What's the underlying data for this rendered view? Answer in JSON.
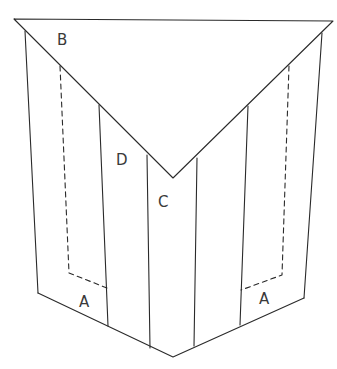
{
  "diagram": {
    "labels": {
      "flap": "B",
      "left_inner_panel": "D",
      "center_panel": "C",
      "left_bottom_panel": "A",
      "right_bottom_panel": "A"
    },
    "colors": {
      "line": "#2a2a2a",
      "label": "#3a3a3a",
      "background": "#ffffff"
    }
  }
}
